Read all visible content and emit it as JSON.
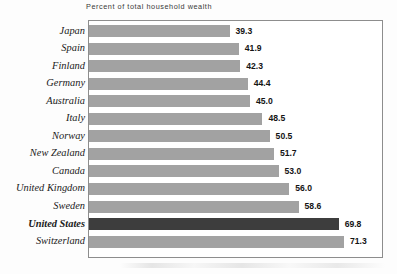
{
  "chart_data": {
    "type": "bar",
    "orientation": "horizontal",
    "title": "Percent of total household wealth",
    "xlabel": "",
    "ylabel": "",
    "grid": false,
    "legend": null,
    "xlim": [
      0,
      75
    ],
    "categories": [
      "Japan",
      "Spain",
      "Finland",
      "Germany",
      "Australia",
      "Italy",
      "Norway",
      "New Zealand",
      "Canada",
      "United Kingdom",
      "Sweden",
      "United States",
      "Switzerland"
    ],
    "values": [
      39.3,
      41.9,
      42.3,
      44.4,
      45.0,
      48.5,
      50.5,
      51.7,
      53.0,
      56.0,
      58.6,
      69.8,
      71.3
    ],
    "value_labels": [
      "39.3",
      "41.9",
      "42.3",
      "44.4",
      "45.0",
      "48.5",
      "50.5",
      "51.7",
      "53.0",
      "56.0",
      "58.6",
      "69.8",
      "71.3"
    ],
    "highlight_category": "United States",
    "colors": {
      "bar": "#a2a2a2",
      "highlight_bar": "#3d3d3d",
      "frame": "#8d8d8d",
      "plot_background": "#ffffff",
      "page_background": "#fdfdfd",
      "label_text": "#1a1a1a",
      "value_text": "#141414",
      "title_text": "#3a3a3a"
    }
  }
}
